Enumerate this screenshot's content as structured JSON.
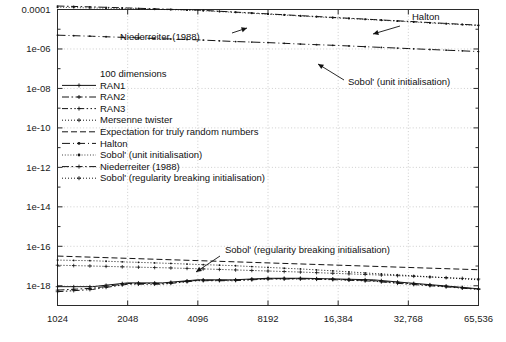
{
  "chart_data": {
    "type": "line",
    "title": "",
    "subtitle": "",
    "xlabel": "",
    "ylabel": "",
    "xscale": "log2",
    "yscale": "log10",
    "xlim": [
      1024,
      65536
    ],
    "ylim": [
      1e-19,
      0.0001
    ],
    "grid": true,
    "legend_position": "center-left",
    "legend_title": "100 dimensions",
    "xticks": [
      1024,
      2048,
      4096,
      8192,
      16384,
      32768,
      65536
    ],
    "xticklabels": [
      "1024",
      "2048",
      "4096",
      "8192",
      "16,384",
      "32,768",
      "65,536"
    ],
    "yticks": [
      0.0001,
      1e-06,
      1e-08,
      1e-10,
      1e-12,
      1e-14,
      1e-16,
      1e-18
    ],
    "yticklabels": [
      "0.0001",
      "1e-06",
      "1e-08",
      "1e-10",
      "1e-12",
      "1e-14",
      "1e-16",
      "1e-18"
    ],
    "annotations": [
      {
        "text": "Niederreiter (1988)",
        "x": 2300,
        "y": 2.2e-05
      },
      {
        "text": "Halton",
        "x": 42000,
        "y": 6e-05
      },
      {
        "text": "Sobol' (unit initialisation)",
        "x": 17000,
        "y": 1.1e-06
      },
      {
        "text": "Sobol' (regularity breaking initialisation)",
        "x": 7000,
        "y": 2e-16
      }
    ],
    "series": [
      {
        "name": "RAN1",
        "style": "solid",
        "marker": "plus",
        "x": [
          1024,
          1448,
          2048,
          2896,
          4096,
          5793,
          8192,
          11585,
          16384,
          23170,
          32768,
          46341,
          65536
        ],
        "y": [
          9e-19,
          9e-19,
          1.4e-18,
          1.4e-18,
          2e-18,
          2e-18,
          2.4e-18,
          2.4e-18,
          2.2e-18,
          2e-18,
          1.4e-18,
          1e-18,
          7e-19
        ]
      },
      {
        "name": "RAN2",
        "style": "dashdot",
        "marker": "plus",
        "x": [
          1024,
          1448,
          2048,
          2896,
          4096,
          5793,
          8192,
          11585,
          16384,
          23170,
          32768,
          46341,
          65536
        ],
        "y": [
          6e-19,
          7.5e-19,
          1.3e-18,
          1.3e-18,
          1.9e-18,
          1.9e-18,
          2.3e-18,
          2.3e-18,
          2.1e-18,
          1.8e-18,
          1.3e-18,
          9.5e-19,
          6.8e-19
        ]
      },
      {
        "name": "RAN3",
        "style": "dashdotdot",
        "marker": "plus",
        "x": [
          1024,
          1448,
          2048,
          2896,
          4096,
          5793,
          8192,
          11585,
          16384,
          23170,
          32768,
          46341,
          65536
        ],
        "y": [
          5e-19,
          6.5e-19,
          1.2e-18,
          1.2e-18,
          1.8e-18,
          1.8e-18,
          2.2e-18,
          2.2e-18,
          2e-18,
          1.7e-18,
          1.2e-18,
          9e-19,
          6.5e-19
        ]
      },
      {
        "name": "Mersenne twister",
        "style": "dotted",
        "marker": "plus",
        "x": [
          1024,
          1448,
          2048,
          2896,
          4096,
          5793,
          8192,
          11585,
          16384,
          23170,
          32768,
          46341,
          65536
        ],
        "y": [
          1.1e-17,
          1e-17,
          9e-18,
          8.2e-18,
          7.3e-18,
          6.4e-18,
          5.6e-18,
          4.9e-18,
          4.2e-18,
          3.6e-18,
          3.1e-18,
          2.6e-18,
          2.2e-18
        ]
      },
      {
        "name": "Expectation for truly random numbers",
        "style": "dashed",
        "marker": "none",
        "x": [
          1024,
          65536
        ],
        "y": [
          3.2e-17,
          6.5e-18
        ]
      },
      {
        "name": "Halton",
        "style": "dashpoint",
        "marker": "dot",
        "x": [
          1024,
          1448,
          2048,
          2896,
          4096,
          5793,
          8192,
          11585,
          16384,
          23170,
          32768,
          46341,
          65536
        ],
        "y": [
          5e-06,
          4.4e-06,
          3.8e-06,
          3.3e-06,
          2.9e-06,
          2.4e-06,
          2.1e-06,
          1.75e-06,
          1.5e-06,
          1.25e-06,
          1.05e-06,
          8.8e-07,
          7.4e-07
        ]
      },
      {
        "name": "Sobol' (unit initialisation)",
        "style": "dottedthin",
        "marker": "dot",
        "x": [
          1024,
          1448,
          2048,
          2896,
          4096,
          5793,
          8192,
          11585,
          16384,
          23170,
          32768,
          46341,
          65536
        ],
        "y": [
          0.00013,
          0.00012,
          0.00011,
          0.0001,
          9e-05,
          7.2e-05,
          5.8e-05,
          4.6e-05,
          3.7e-05,
          3e-05,
          2.4e-05,
          1.9e-05,
          1.55e-05
        ]
      },
      {
        "name": "Niederreiter (1988)",
        "style": "dashdot",
        "marker": "dot",
        "x": [
          1024,
          1448,
          2048,
          2896,
          4096,
          5793,
          8192,
          11585,
          16384,
          23170,
          32768,
          46341,
          65536
        ],
        "y": [
          0.00015,
          0.000135,
          0.00012,
          0.000105,
          9.3e-05,
          7.5e-05,
          6e-05,
          4.8e-05,
          3.85e-05,
          3.1e-05,
          2.5e-05,
          2e-05,
          1.6e-05
        ]
      },
      {
        "name": "Sobol' (regularity breaking initialisation)",
        "style": "dotted",
        "marker": "dot",
        "x": [
          1024,
          1448,
          2048,
          2896,
          4096,
          5793,
          8192,
          11585,
          16384,
          23170,
          32768,
          46341,
          65536
        ],
        "y": [
          2e-17,
          1.85e-17,
          1.6e-17,
          1.4e-17,
          1.2e-17,
          1.05e-17,
          8.5e-18,
          7e-18,
          5.5e-18,
          4.2e-18,
          3.3e-18,
          2.6e-18,
          2e-18
        ]
      }
    ],
    "legend_entries": [
      {
        "label": "RAN1",
        "style": "solid"
      },
      {
        "label": "RAN2",
        "style": "dashdot"
      },
      {
        "label": "RAN3",
        "style": "dashdotdot"
      },
      {
        "label": "Mersenne twister",
        "style": "dotted"
      },
      {
        "label": "Expectation for truly random numbers",
        "style": "dashed"
      },
      {
        "label": "Halton",
        "style": "dashpoint"
      },
      {
        "label": "Sobol' (unit initialisation)",
        "style": "dottedthin"
      },
      {
        "label": "Niederreiter (1988)",
        "style": "dashdot"
      },
      {
        "label": "Sobol' (regularity breaking initialisation)",
        "style": "dotted"
      }
    ]
  },
  "colors": {
    "background": "#ffffff",
    "ink": "#141414",
    "grid": "#b9b9b9",
    "frame": "#2b2b2b"
  }
}
